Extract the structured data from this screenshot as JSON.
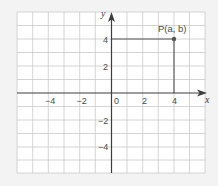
{
  "diagram": {
    "type": "coordinate-grid",
    "x_range": [
      -6,
      6
    ],
    "y_range": [
      -6,
      6
    ],
    "axis_labels": {
      "x": "x",
      "y": "y"
    },
    "x_ticks": [
      {
        "value": -4,
        "label": "−4"
      },
      {
        "value": -2,
        "label": "−2"
      },
      {
        "value": 0,
        "label": "0"
      },
      {
        "value": 2,
        "label": "2"
      },
      {
        "value": 4,
        "label": "4"
      }
    ],
    "y_ticks": [
      {
        "value": 4,
        "label": "4"
      },
      {
        "value": 2,
        "label": "2"
      },
      {
        "value": -2,
        "label": "−2"
      },
      {
        "value": -4,
        "label": "−4"
      }
    ],
    "point": {
      "label": "P(a, b)",
      "x": 4,
      "y": 4
    },
    "colors": {
      "background": "#f3f3f3",
      "grid_fill": "#ffffff",
      "grid_lines": "#c9c9c9",
      "axes": "#3d3d3d",
      "point": "#555555"
    }
  }
}
